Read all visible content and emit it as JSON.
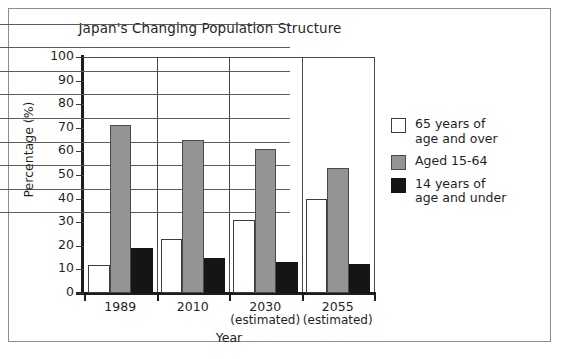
{
  "chart_data": {
    "type": "bar",
    "title": "Japan's Changing Population Structure",
    "xlabel": "Year",
    "ylabel": "Percentage (%)",
    "ylim": [
      0,
      100
    ],
    "ytick_step": 10,
    "yticks": [
      "100",
      "90",
      "80",
      "70",
      "60",
      "50",
      "40",
      "30",
      "20",
      "10",
      "0"
    ],
    "grid": "horizontal",
    "legend_position": "right",
    "categories": [
      "1989",
      "2010",
      "2030",
      "2055"
    ],
    "category_notes": [
      "",
      "",
      "(estimated)",
      "(estimated)"
    ],
    "series": [
      {
        "name": "65 years of\nage and over",
        "color": "#ffffff",
        "values": [
          12,
          23,
          31,
          40
        ]
      },
      {
        "name": "Aged 15-64",
        "color": "#949494",
        "values": [
          71,
          65,
          61,
          53
        ]
      },
      {
        "name": "14 years of\nage and under",
        "color": "#151515",
        "values": [
          19,
          15,
          13,
          12.5
        ]
      }
    ]
  },
  "colors": {
    "white_series": "#ffffff",
    "gray_series": "#949494",
    "black_series": "#151515",
    "axis": "#1c1c1c",
    "grid": "#5a5a5a",
    "frame": "#8d8d8d",
    "text": "#1f1f1f"
  }
}
